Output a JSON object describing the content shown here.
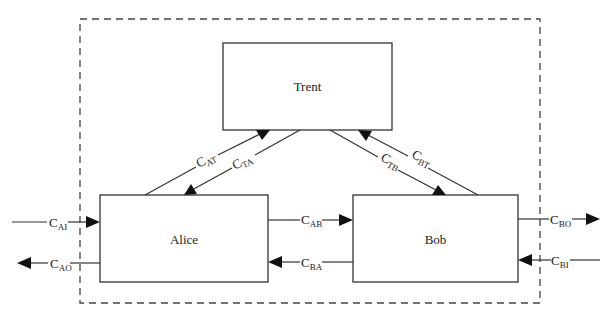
{
  "diagram": {
    "boundary": {
      "label": ""
    },
    "nodes": {
      "trent": {
        "label": "Trent"
      },
      "alice": {
        "label": "Alice"
      },
      "bob": {
        "label": "Bob"
      }
    },
    "edges": {
      "c_ai": {
        "base": "C",
        "sub": "AI",
        "from": "external",
        "to": "Alice"
      },
      "c_ao": {
        "base": "C",
        "sub": "AO",
        "from": "Alice",
        "to": "external"
      },
      "c_at": {
        "base": "C",
        "sub": "AT",
        "from": "Alice",
        "to": "Trent"
      },
      "c_ta": {
        "base": "C",
        "sub": "TA",
        "from": "Trent",
        "to": "Alice"
      },
      "c_tb": {
        "base": "C",
        "sub": "TB",
        "from": "Trent",
        "to": "Bob"
      },
      "c_bt": {
        "base": "C",
        "sub": "BT",
        "from": "Bob",
        "to": "Trent"
      },
      "c_ab": {
        "base": "C",
        "sub": "AB",
        "from": "Alice",
        "to": "Bob"
      },
      "c_ba": {
        "base": "C",
        "sub": "BA",
        "from": "Bob",
        "to": "Alice"
      },
      "c_bo": {
        "base": "C",
        "sub": "BO",
        "from": "Bob",
        "to": "external"
      },
      "c_bi": {
        "base": "C",
        "sub": "BI",
        "from": "external",
        "to": "Bob"
      }
    }
  }
}
